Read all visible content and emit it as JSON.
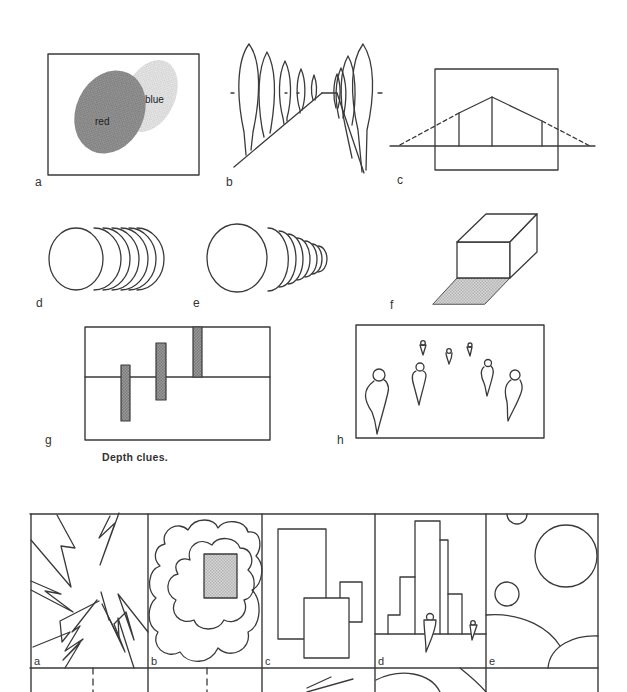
{
  "page": {
    "caption": "Depth clues.",
    "colors": {
      "line": "#3a3a3a",
      "dark_fill": "#8a8a8a",
      "light_fill": "#d8d8d8",
      "paper": "#ffffff"
    }
  },
  "top_figures": {
    "a": {
      "label": "a",
      "description": "Overlapping color ovals",
      "red_label": "red",
      "blue_label": "blue"
    },
    "b": {
      "label": "b",
      "description": "Converging avenue of trees"
    },
    "c": {
      "label": "c",
      "description": "Perspective building with vanishing lines"
    },
    "d": {
      "label": "d",
      "description": "Overlapping equal circles"
    },
    "e": {
      "label": "e",
      "description": "Overlapping diminishing circles"
    },
    "f": {
      "label": "f",
      "description": "Box with cast shadow"
    },
    "g": {
      "label": "g",
      "description": "Bars relative to horizon line"
    },
    "h": {
      "label": "h",
      "description": "Figures diminishing with distance"
    }
  },
  "bottom_grid": {
    "cells": [
      {
        "label": "a",
        "description": "Zig-zag lightning strokes"
      },
      {
        "label": "b",
        "description": "Cloud shapes around shaded rectangle"
      },
      {
        "label": "c",
        "description": "Overlapping rectangles"
      },
      {
        "label": "d",
        "description": "Stepped skyline with figures"
      },
      {
        "label": "e",
        "description": "Circles of varying size"
      }
    ]
  }
}
